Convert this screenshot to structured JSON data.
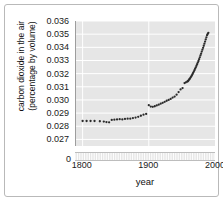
{
  "chart_data": {
    "type": "scatter",
    "title": "",
    "xlabel": "year",
    "ylabel": "carbon dioxide in the air (percentage by volume)",
    "ylabel_line1": "carbon dioxide in the air",
    "ylabel_line2": "(percentage by volume)",
    "xlim": [
      1790,
      2000
    ],
    "ylim": [
      0.0265,
      0.036
    ],
    "xticks": [
      "1800",
      "1900",
      "2000"
    ],
    "xtick_values": [
      1800,
      1900,
      2000
    ],
    "yticks": [
      "0.027",
      "0.028",
      "0.029",
      "0.030",
      "0.031",
      "0.032",
      "0.033",
      "0.034",
      "0.035",
      "0.036"
    ],
    "ytick_values": [
      0.027,
      0.028,
      0.029,
      0.03,
      0.031,
      0.032,
      0.033,
      0.034,
      0.035,
      0.036
    ],
    "y_axis_break_label": "0",
    "grid": true,
    "grid_color": "#ffffff",
    "plot_background": "#e6e6e6",
    "marker_color": "#2b2b2b",
    "legend": null,
    "series": [
      {
        "name": "carbon dioxide concentration",
        "x": [
          1800,
          1806,
          1812,
          1818,
          1826,
          1832,
          1836,
          1840,
          1844,
          1848,
          1852,
          1856,
          1860,
          1864,
          1868,
          1872,
          1876,
          1880,
          1884,
          1888,
          1892,
          1896,
          1900,
          1903,
          1906,
          1909,
          1912,
          1915,
          1918,
          1921,
          1924,
          1927,
          1930,
          1933,
          1936,
          1939,
          1942,
          1945,
          1948,
          1951,
          1954,
          1956,
          1958,
          1959,
          1960,
          1961,
          1962,
          1963,
          1964,
          1965,
          1966,
          1967,
          1968,
          1969,
          1970,
          1971,
          1972,
          1973,
          1974,
          1975,
          1976,
          1977,
          1978,
          1979,
          1980,
          1981,
          1982,
          1983,
          1984,
          1985,
          1986,
          1987,
          1988,
          1989,
          1990
        ],
        "y": [
          0.0284,
          0.0284,
          0.0284,
          0.0284,
          0.02838,
          0.02836,
          0.02832,
          0.0283,
          0.02848,
          0.0285,
          0.02852,
          0.02854,
          0.02852,
          0.02856,
          0.02858,
          0.02858,
          0.02862,
          0.02866,
          0.02872,
          0.0288,
          0.02888,
          0.02894,
          0.0296,
          0.0295,
          0.02948,
          0.02952,
          0.02958,
          0.02964,
          0.02972,
          0.02978,
          0.02986,
          0.02994,
          0.03,
          0.03008,
          0.03018,
          0.03026,
          0.0304,
          0.0306,
          0.0308,
          0.0309,
          0.03128,
          0.03134,
          0.0314,
          0.03142,
          0.03148,
          0.03156,
          0.03162,
          0.0317,
          0.03178,
          0.03186,
          0.03196,
          0.03206,
          0.03216,
          0.03226,
          0.03238,
          0.03248,
          0.0326,
          0.03272,
          0.03284,
          0.03296,
          0.0331,
          0.03324,
          0.03338,
          0.03352,
          0.03368,
          0.03382,
          0.03396,
          0.03412,
          0.03428,
          0.03444,
          0.0346,
          0.03476,
          0.03492,
          0.03502,
          0.0351
        ]
      }
    ]
  }
}
